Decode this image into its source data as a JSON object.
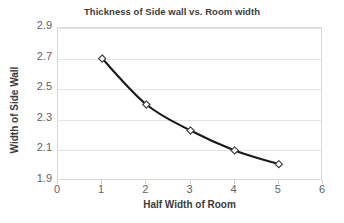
{
  "chart_data": {
    "type": "line",
    "title": "Thickness of Side wall vs. Room width",
    "xlabel": "Half Width of Room",
    "ylabel": "Width of Side Wall",
    "x": [
      1,
      2,
      3,
      4,
      5
    ],
    "values": [
      2.7,
      2.4,
      2.23,
      2.1,
      2.01
    ],
    "series": [
      {
        "name": "Width of Side Wall",
        "x": [
          1,
          2,
          3,
          4,
          5
        ],
        "values": [
          2.7,
          2.4,
          2.23,
          2.1,
          2.01
        ]
      }
    ],
    "xlim": [
      0,
      6
    ],
    "ylim": [
      1.9,
      2.9
    ],
    "xticks": [
      "0",
      "1",
      "2",
      "3",
      "4",
      "5",
      "6"
    ],
    "yticks": [
      "1.9",
      "2.1",
      "2.3",
      "2.5",
      "2.7",
      "2.9"
    ],
    "grid": "horizontal",
    "legend": "none",
    "marker": "open-diamond",
    "line_color": "#1a1a1a",
    "marker_fill": "#ffffff",
    "marker_edge": "#3f3f3f",
    "gridline_color": "#e4e4e4",
    "background_color": "#ffffff",
    "text_color": "#595959"
  }
}
